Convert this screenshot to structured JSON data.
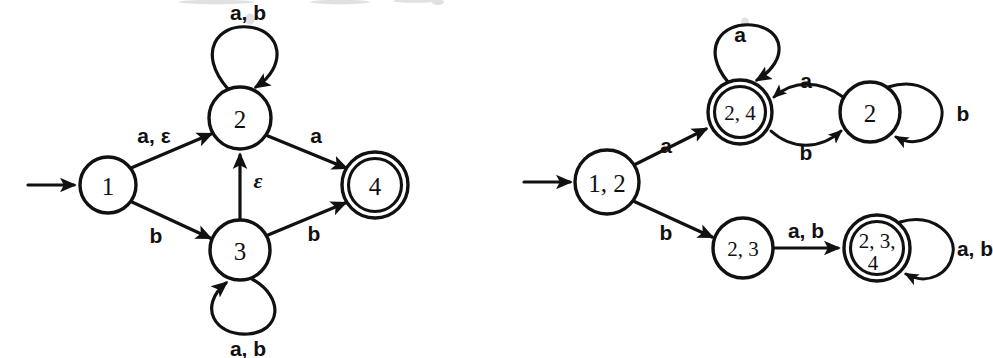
{
  "page": {
    "width": 993,
    "height": 358,
    "background": "#ffffff",
    "ink_color": "#111111"
  },
  "diagrams": [
    {
      "id": "nfa-left",
      "name": "nfa-with-epsilon-transitions",
      "start_state": "1",
      "accept_states": [
        "4"
      ],
      "states": [
        {
          "id": "s1",
          "label": "1",
          "cx": 108,
          "cy": 185,
          "r": 28,
          "accepting": false
        },
        {
          "id": "s2",
          "label": "2",
          "cx": 240,
          "cy": 118,
          "r": 31,
          "accepting": false
        },
        {
          "id": "s3",
          "label": "3",
          "cx": 240,
          "cy": 250,
          "r": 30,
          "accepting": false
        },
        {
          "id": "s4",
          "label": "4",
          "cx": 375,
          "cy": 185,
          "r": 33,
          "accepting": true
        }
      ],
      "transitions": [
        {
          "from": "1",
          "to": "2",
          "label": "a, ε",
          "label_kind": "mixed"
        },
        {
          "from": "1",
          "to": "3",
          "label": "b",
          "label_kind": "plain"
        },
        {
          "from": "2",
          "to": "2",
          "label": "a, b",
          "label_kind": "plain",
          "self_loop": true
        },
        {
          "from": "2",
          "to": "4",
          "label": "a",
          "label_kind": "plain"
        },
        {
          "from": "3",
          "to": "2",
          "label": "ε",
          "label_kind": "epsilon"
        },
        {
          "from": "3",
          "to": "3",
          "label": "a, b",
          "label_kind": "plain",
          "self_loop": true
        },
        {
          "from": "3",
          "to": "4",
          "label": "b",
          "label_kind": "plain"
        }
      ],
      "labels": {
        "one_two": "a, ε",
        "one_three": "b",
        "two_loop": "a, b",
        "two_four": "a",
        "three_two": "ε",
        "three_loop": "a, b",
        "three_four": "b"
      }
    },
    {
      "id": "dfa-right",
      "name": "equivalent-dfa-subset-construction",
      "start_state": "1, 2",
      "accept_states": [
        "2, 4",
        "2, 3, 4"
      ],
      "states": [
        {
          "id": "d12",
          "label": "1, 2",
          "cx": 607,
          "cy": 182,
          "r": 32,
          "accepting": false
        },
        {
          "id": "d24",
          "label": "2, 4",
          "cx": 740,
          "cy": 112,
          "r": 32,
          "accepting": true
        },
        {
          "id": "d2",
          "label": "2",
          "cx": 870,
          "cy": 112,
          "r": 30,
          "accepting": false
        },
        {
          "id": "d23",
          "label": "2, 3",
          "cx": 743,
          "cy": 248,
          "r": 30,
          "accepting": false
        },
        {
          "id": "d234",
          "label_line1": "2, 3,",
          "label_line2": "4",
          "label": "2, 3, 4",
          "cx": 877,
          "cy": 248,
          "r": 33,
          "accepting": true
        }
      ],
      "transitions": [
        {
          "from": "1, 2",
          "to": "2, 4",
          "label": "a"
        },
        {
          "from": "1, 2",
          "to": "2, 3",
          "label": "b"
        },
        {
          "from": "2, 4",
          "to": "2, 4",
          "label": "a",
          "self_loop": true
        },
        {
          "from": "2, 4",
          "to": "2",
          "label": "b"
        },
        {
          "from": "2",
          "to": "2, 4",
          "label": "a"
        },
        {
          "from": "2",
          "to": "2",
          "label": "b",
          "self_loop": true
        },
        {
          "from": "2, 3",
          "to": "2, 3, 4",
          "label": "a, b"
        },
        {
          "from": "2, 3, 4",
          "to": "2, 3, 4",
          "label": "a, b",
          "self_loop": true
        }
      ],
      "labels": {
        "start_a": "a",
        "start_b": "b",
        "loop_24": "a",
        "b24_to_2": "b",
        "a2_to_24": "a",
        "loop_2": "b",
        "a_b_23_to_234": "a, b",
        "loop_234": "a, b"
      }
    }
  ]
}
